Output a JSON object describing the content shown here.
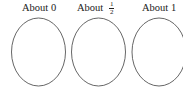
{
  "groups": [
    {
      "label_text": "About",
      "label_value": "0",
      "fraction": null
    },
    {
      "label_text": "About",
      "label_value": null,
      "fraction": {
        "numerator": "1",
        "denominator": "2"
      }
    },
    {
      "label_text": "About",
      "label_value": "1",
      "fraction": null
    }
  ],
  "colors": {
    "stroke": "#555555",
    "background": "#ffffff",
    "text": "#222222"
  }
}
